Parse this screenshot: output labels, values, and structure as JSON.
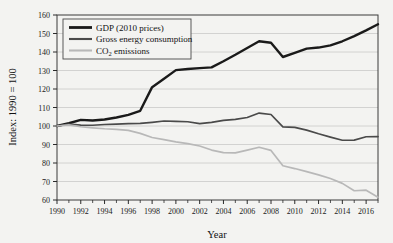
{
  "chart_data": {
    "type": "line",
    "title": "",
    "xlabel": "Year",
    "ylabel": "Index: 1990 = 100",
    "ylim": [
      60,
      160
    ],
    "xlim": [
      1990,
      2017
    ],
    "ytick_step": 10,
    "yticks": [
      60,
      70,
      80,
      90,
      100,
      110,
      120,
      130,
      140,
      150,
      160
    ],
    "xticks": [
      1990,
      1992,
      1994,
      1996,
      1998,
      2000,
      2002,
      2004,
      2006,
      2008,
      2010,
      2012,
      2014,
      2016
    ],
    "xticks_minor": [
      1991,
      1993,
      1995,
      1997,
      1999,
      2001,
      2003,
      2005,
      2007,
      2009,
      2011,
      2013,
      2015,
      2017
    ],
    "grid": "horizontal",
    "legend_position": "top-left",
    "x": [
      1990,
      1991,
      1992,
      1993,
      1994,
      1995,
      1996,
      1997,
      1998,
      1999,
      2000,
      2001,
      2002,
      2003,
      2004,
      2005,
      2006,
      2007,
      2008,
      2009,
      2010,
      2011,
      2012,
      2013,
      2014,
      2015,
      2016,
      2017
    ],
    "series": [
      {
        "name": "GDP (2010 prices)",
        "color": "#1a1a1a",
        "width": 2.4,
        "values": [
          100.0,
          101.5,
          103.3,
          103.0,
          103.5,
          104.6,
          106.0,
          108.2,
          121.0,
          125.5,
          130.2,
          130.8,
          131.3,
          131.7,
          135.0,
          138.5,
          142.2,
          145.8,
          145.0,
          137.3,
          139.5,
          141.8,
          142.4,
          143.6,
          145.8,
          148.6,
          151.7,
          155.0
        ]
      },
      {
        "name": "Gross energy consumption",
        "color": "#4a4a4a",
        "width": 1.7,
        "values": [
          100.0,
          101.0,
          100.5,
          100.4,
          100.8,
          101.0,
          101.3,
          101.4,
          102.0,
          102.7,
          102.5,
          102.3,
          101.3,
          102.0,
          103.0,
          103.6,
          104.6,
          107.0,
          106.2,
          99.5,
          99.3,
          97.8,
          95.8,
          94.0,
          92.3,
          92.4,
          94.2,
          94.3
        ]
      },
      {
        "name": "CO₂ emissions",
        "color": "#b8b8b8",
        "width": 1.7,
        "values": [
          100.0,
          100.6,
          99.6,
          99.0,
          98.5,
          98.2,
          97.6,
          96.0,
          93.8,
          92.6,
          91.4,
          90.5,
          89.2,
          87.0,
          85.6,
          85.5,
          87.0,
          88.5,
          86.8,
          78.5,
          77.0,
          75.3,
          73.6,
          71.6,
          69.0,
          65.0,
          65.3,
          61.5
        ]
      }
    ]
  },
  "legend": {
    "items": [
      {
        "label": "GDP (2010 prices)"
      },
      {
        "label": "Gross energy consumption"
      },
      {
        "label_main": "CO",
        "label_sub": "2",
        "label_tail": " emissions"
      }
    ]
  },
  "axes": {
    "x_title": "Year",
    "y_title": "Index: 1990 = 100"
  }
}
